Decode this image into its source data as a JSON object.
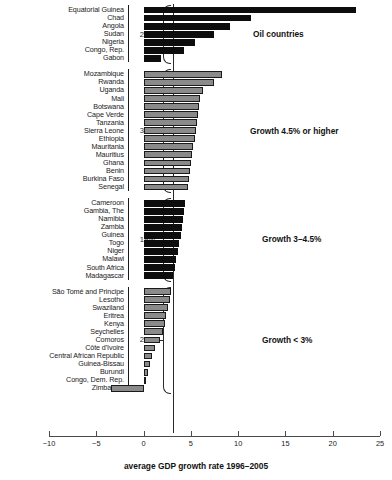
{
  "chart_data": {
    "type": "bar",
    "title": "",
    "xlabel": "average GDP growth rate 1996–2005",
    "ylabel": "",
    "xlim": [
      -10,
      25
    ],
    "xticks": [
      -10,
      -5,
      0,
      5,
      10,
      15,
      20,
      25
    ],
    "xtick_labels": [
      "−10",
      "−5",
      "0",
      "5",
      "10",
      "15",
      "20",
      "25"
    ],
    "orientation": "horizontal",
    "grid": false,
    "legend": "none",
    "groups": [
      {
        "id": "oil-countries",
        "note": "Oil countries",
        "share_label": "27%",
        "color": "#0d0d0d",
        "categories": [
          "Equatorial Guinea",
          "Chad",
          "Angola",
          "Sudan",
          "Nigeria",
          "Congo, Rep.",
          "Gabon"
        ],
        "values": [
          22.5,
          11.4,
          9.1,
          7.4,
          5.4,
          4.3,
          1.8
        ]
      },
      {
        "id": "growth-4-5-or-higher",
        "note": "Growth 4.5% or higher",
        "share_label": "34%",
        "color": "#8a8a8a",
        "categories": [
          "Mozambique",
          "Rwanda",
          "Uganda",
          "Mali",
          "Botswana",
          "Cape Verde",
          "Tanzania",
          "Sierra Leone",
          "Ethiopia",
          "Mauritania",
          "Mauritius",
          "Ghana",
          "Benin",
          "Burkina Faso",
          "Senegal"
        ],
        "values": [
          8.3,
          7.5,
          6.3,
          6.0,
          5.9,
          5.8,
          5.6,
          5.5,
          5.4,
          5.2,
          5.1,
          5.0,
          4.9,
          4.8,
          4.7
        ]
      },
      {
        "id": "growth-3-to-4-5",
        "note": "Growth 3–4.5%",
        "share_label": "19%",
        "color": "#0d0d0d",
        "categories": [
          "Cameroon",
          "Gambia, The",
          "Namibia",
          "Zambia",
          "Guinea",
          "Togo",
          "Niger",
          "Malawi",
          "South Africa",
          "Madagascar"
        ],
        "values": [
          4.4,
          4.3,
          4.2,
          4.1,
          4.0,
          3.8,
          3.6,
          3.4,
          3.3,
          3.1
        ]
      },
      {
        "id": "growth-under-3",
        "note": "Growth < 3%",
        "share_label": "20%",
        "color": "#8a8a8a",
        "categories": [
          "São Tomé and Principe",
          "Lesotho",
          "Swaziland",
          "Eritrea",
          "Kenya",
          "Seychelles",
          "Comoros",
          "Côte d'Ivoire",
          "Central African Republic",
          "Guinea-Bissau",
          "Burundi",
          "Congo, Dem. Rep.",
          "Zimbabwe"
        ],
        "values": [
          2.9,
          2.8,
          2.6,
          2.4,
          2.3,
          2.1,
          1.7,
          1.2,
          0.9,
          0.7,
          0.5,
          0.3,
          -3.4
        ]
      }
    ]
  }
}
